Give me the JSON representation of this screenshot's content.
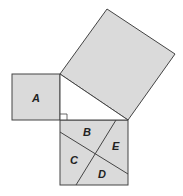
{
  "diagram": {
    "type": "pythagorean-dissection",
    "fill_color": "#dadada",
    "stroke_color": "#444444",
    "labels": {
      "a": "A",
      "b": "B",
      "c": "C",
      "d": "D",
      "e": "E"
    }
  }
}
